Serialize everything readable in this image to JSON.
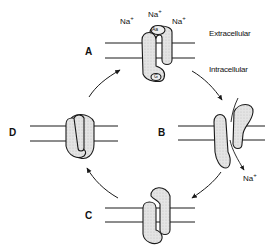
{
  "diagram": {
    "type": "reaction-cycle",
    "states": [
      {
        "id": "A",
        "label": "A",
        "sites": [
          "Aa",
          "G"
        ]
      },
      {
        "id": "B",
        "label": "B"
      },
      {
        "id": "C",
        "label": "C"
      },
      {
        "id": "D",
        "label": "D"
      }
    ],
    "ions": {
      "top_left": "Na",
      "top_center": "Na",
      "top_right": "Na",
      "released": "Na",
      "charge": "+"
    },
    "regions": {
      "extracellular": "Extracellular",
      "intracellular": "Intracellular"
    },
    "sites": {
      "top": "Aa",
      "bottom": "G"
    },
    "cycle_order": [
      "A",
      "B",
      "C",
      "D",
      "A"
    ],
    "colors": {
      "stroke": "#1a1a1a",
      "protein_fill": "#dcdcdc",
      "background": "#ffffff"
    }
  }
}
